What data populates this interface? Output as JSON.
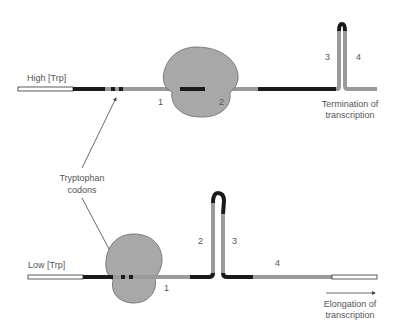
{
  "diagram": {
    "colors": {
      "background": "#ffffff",
      "rna_dark": "#1a1a1a",
      "rna_grey": "#9a9a9a",
      "rna_white": "#ffffff",
      "ribosome_fill": "#a8a8a8",
      "ribosome_stroke": "#6a6a6a",
      "text": "#555555",
      "arrow": "#444444"
    },
    "top_panel": {
      "condition_label": "High [Trp]",
      "region_labels": [
        "1",
        "2",
        "3",
        "4"
      ],
      "outcome_line1": "Termination of",
      "outcome_line2": "transcription"
    },
    "bottom_panel": {
      "condition_label": "Low [Trp]",
      "region_labels": [
        "1",
        "2",
        "3",
        "4"
      ],
      "outcome_line1": "Elongation of",
      "outcome_line2": "transcription"
    },
    "shared": {
      "codon_label_line1": "Tryptophan",
      "codon_label_line2": "codons"
    }
  }
}
